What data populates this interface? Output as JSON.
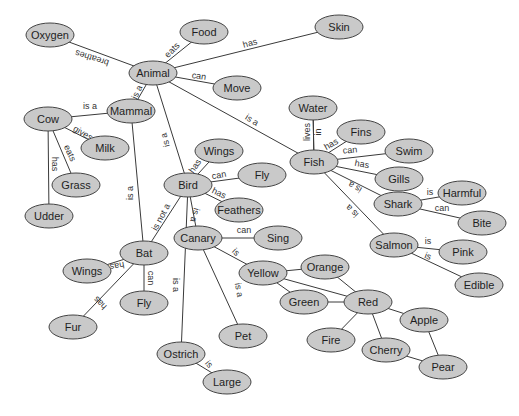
{
  "diagram": {
    "type": "semantic-network",
    "colors": {
      "node_fill": "#c9c9c9",
      "node_stroke": "#444444",
      "edge": "#3a3a3a",
      "background": "#ffffff"
    },
    "nodes": [
      {
        "id": "oxygen",
        "label": "Oxygen",
        "x": 50,
        "y": 35,
        "rx": 24,
        "ry": 12
      },
      {
        "id": "food",
        "label": "Food",
        "x": 204,
        "y": 32,
        "rx": 24,
        "ry": 12
      },
      {
        "id": "skin",
        "label": "Skin",
        "x": 339,
        "y": 27,
        "rx": 24,
        "ry": 12
      },
      {
        "id": "animal",
        "label": "Animal",
        "x": 153,
        "y": 73,
        "rx": 24,
        "ry": 12
      },
      {
        "id": "move",
        "label": "Move",
        "x": 237,
        "y": 88,
        "rx": 24,
        "ry": 12
      },
      {
        "id": "mammal",
        "label": "Mammal",
        "x": 131,
        "y": 111,
        "rx": 24,
        "ry": 12
      },
      {
        "id": "cow",
        "label": "Cow",
        "x": 48,
        "y": 119,
        "rx": 24,
        "ry": 12
      },
      {
        "id": "milk",
        "label": "Milk",
        "x": 105,
        "y": 148,
        "rx": 24,
        "ry": 12
      },
      {
        "id": "grass",
        "label": "Grass",
        "x": 76,
        "y": 185,
        "rx": 24,
        "ry": 12
      },
      {
        "id": "udder",
        "label": "Udder",
        "x": 49,
        "y": 216,
        "rx": 24,
        "ry": 12
      },
      {
        "id": "water",
        "label": "Water",
        "x": 313,
        "y": 108,
        "rx": 24,
        "ry": 12
      },
      {
        "id": "fins",
        "label": "Fins",
        "x": 361,
        "y": 132,
        "rx": 24,
        "ry": 12
      },
      {
        "id": "wings_bird",
        "label": "Wings",
        "x": 219,
        "y": 151,
        "rx": 24,
        "ry": 12
      },
      {
        "id": "fly_bird",
        "label": "Fly",
        "x": 262,
        "y": 175,
        "rx": 24,
        "ry": 12
      },
      {
        "id": "fish",
        "label": "Fish",
        "x": 314,
        "y": 162,
        "rx": 24,
        "ry": 12
      },
      {
        "id": "swim",
        "label": "Swim",
        "x": 409,
        "y": 151,
        "rx": 24,
        "ry": 12
      },
      {
        "id": "gills",
        "label": "Gills",
        "x": 399,
        "y": 179,
        "rx": 24,
        "ry": 12
      },
      {
        "id": "bird",
        "label": "Bird",
        "x": 188,
        "y": 185,
        "rx": 24,
        "ry": 12
      },
      {
        "id": "feathers",
        "label": "Feathers",
        "x": 239,
        "y": 210,
        "rx": 24,
        "ry": 12
      },
      {
        "id": "shark",
        "label": "Shark",
        "x": 398,
        "y": 204,
        "rx": 24,
        "ry": 12
      },
      {
        "id": "harmful",
        "label": "Harmful",
        "x": 462,
        "y": 193,
        "rx": 24,
        "ry": 12
      },
      {
        "id": "bite",
        "label": "Bite",
        "x": 482,
        "y": 223,
        "rx": 24,
        "ry": 12
      },
      {
        "id": "canary",
        "label": "Canary",
        "x": 198,
        "y": 238,
        "rx": 24,
        "ry": 12
      },
      {
        "id": "sing",
        "label": "Sing",
        "x": 278,
        "y": 238,
        "rx": 24,
        "ry": 12
      },
      {
        "id": "bat",
        "label": "Bat",
        "x": 144,
        "y": 253,
        "rx": 24,
        "ry": 12
      },
      {
        "id": "salmon",
        "label": "Salmon",
        "x": 394,
        "y": 245,
        "rx": 24,
        "ry": 12
      },
      {
        "id": "pink",
        "label": "Pink",
        "x": 463,
        "y": 252,
        "rx": 24,
        "ry": 12
      },
      {
        "id": "yellow",
        "label": "Yellow",
        "x": 263,
        "y": 273,
        "rx": 24,
        "ry": 12
      },
      {
        "id": "orange",
        "label": "Orange",
        "x": 325,
        "y": 267,
        "rx": 24,
        "ry": 12
      },
      {
        "id": "wings_bat",
        "label": "Wings",
        "x": 87,
        "y": 271,
        "rx": 24,
        "ry": 12
      },
      {
        "id": "green",
        "label": "Green",
        "x": 304,
        "y": 302,
        "rx": 24,
        "ry": 12
      },
      {
        "id": "red",
        "label": "Red",
        "x": 368,
        "y": 302,
        "rx": 24,
        "ry": 12
      },
      {
        "id": "edible",
        "label": "Edible",
        "x": 479,
        "y": 285,
        "rx": 24,
        "ry": 12
      },
      {
        "id": "apple",
        "label": "Apple",
        "x": 424,
        "y": 320,
        "rx": 24,
        "ry": 12
      },
      {
        "id": "fly_bat",
        "label": "Fly",
        "x": 144,
        "y": 303,
        "rx": 24,
        "ry": 12
      },
      {
        "id": "fur",
        "label": "Fur",
        "x": 73,
        "y": 327,
        "rx": 24,
        "ry": 12
      },
      {
        "id": "pet",
        "label": "Pet",
        "x": 243,
        "y": 336,
        "rx": 24,
        "ry": 12
      },
      {
        "id": "fire",
        "label": "Fire",
        "x": 331,
        "y": 340,
        "rx": 24,
        "ry": 12
      },
      {
        "id": "cherry",
        "label": "Cherry",
        "x": 386,
        "y": 350,
        "rx": 24,
        "ry": 12
      },
      {
        "id": "ostrich",
        "label": "Ostrich",
        "x": 181,
        "y": 354,
        "rx": 24,
        "ry": 12
      },
      {
        "id": "pear",
        "label": "Pear",
        "x": 443,
        "y": 367,
        "rx": 24,
        "ry": 12
      },
      {
        "id": "large",
        "label": "Large",
        "x": 227,
        "y": 382,
        "rx": 24,
        "ry": 12
      }
    ],
    "edges": [
      {
        "from": "animal",
        "to": "oxygen",
        "label": "breathes",
        "lx": 92,
        "ly": 58,
        "rot": 198
      },
      {
        "from": "animal",
        "to": "food",
        "label": "eats",
        "lx": 172,
        "ly": 50,
        "rot": -45
      },
      {
        "from": "animal",
        "to": "skin",
        "label": "has",
        "lx": 250,
        "ly": 43,
        "rot": -16
      },
      {
        "from": "animal",
        "to": "move",
        "label": "can",
        "lx": 199,
        "ly": 76,
        "rot": 8
      },
      {
        "from": "mammal",
        "to": "animal",
        "label": "is a",
        "lx": 137,
        "ly": 92,
        "rot": -65
      },
      {
        "from": "cow",
        "to": "mammal",
        "label": "is a",
        "lx": 90,
        "ly": 106,
        "rot": 0
      },
      {
        "from": "cow",
        "to": "milk",
        "label": "gives",
        "lx": 83,
        "ly": 133,
        "rot": 30
      },
      {
        "from": "cow",
        "to": "grass",
        "label": "eats",
        "lx": 70,
        "ly": 153,
        "rot": 65
      },
      {
        "from": "cow",
        "to": "udder",
        "label": "has",
        "lx": 55,
        "ly": 164,
        "rot": 90
      },
      {
        "from": "bird",
        "to": "animal",
        "label": "is a",
        "lx": 165,
        "ly": 140,
        "rot": -105
      },
      {
        "from": "fish",
        "to": "animal",
        "label": "is a",
        "lx": 252,
        "ly": 120,
        "rot": 32
      },
      {
        "from": "bat",
        "to": "mammal",
        "label": "is a",
        "lx": 130,
        "ly": 193,
        "rot": -90
      },
      {
        "from": "bat",
        "to": "bird",
        "label": "is not a",
        "lx": 161,
        "ly": 217,
        "rot": -62
      },
      {
        "from": "bird",
        "to": "wings_bird",
        "label": "has",
        "lx": 195,
        "ly": 166,
        "rot": -55
      },
      {
        "from": "bird",
        "to": "fly_bird",
        "label": "can",
        "lx": 219,
        "ly": 175,
        "rot": -10
      },
      {
        "from": "bird",
        "to": "feathers",
        "label": "has",
        "lx": 219,
        "ly": 193,
        "rot": 25
      },
      {
        "from": "canary",
        "to": "bird",
        "label": "is a",
        "lx": 195,
        "ly": 215,
        "rot": 105
      },
      {
        "from": "ostrich",
        "to": "bird",
        "label": "is a",
        "lx": 176,
        "ly": 285,
        "rot": 90
      },
      {
        "from": "canary",
        "to": "sing",
        "label": "can",
        "lx": 244,
        "ly": 230,
        "rot": 0
      },
      {
        "from": "canary",
        "to": "yellow",
        "label": "is",
        "lx": 236,
        "ly": 252,
        "rot": 45
      },
      {
        "from": "canary",
        "to": "pet",
        "label": "is a",
        "lx": 239,
        "ly": 290,
        "rot": 80
      },
      {
        "from": "ostrich",
        "to": "large",
        "label": "is",
        "lx": 209,
        "ly": 364,
        "rot": 50
      },
      {
        "from": "bat",
        "to": "wings_bat",
        "label": "has",
        "lx": 117,
        "ly": 266,
        "rot": 170
      },
      {
        "from": "bat",
        "to": "fly_bat",
        "label": "can",
        "lx": 151,
        "ly": 278,
        "rot": 90
      },
      {
        "from": "bat",
        "to": "fur",
        "label": "has",
        "lx": 100,
        "ly": 303,
        "rot": 225
      },
      {
        "from": "fish",
        "to": "water",
        "label": "lives",
        "lx": 307,
        "ly": 132,
        "rot": -90
      },
      {
        "from": "fish",
        "to": "water",
        "label": "in",
        "lx": 318,
        "ly": 132,
        "rot": -90
      },
      {
        "from": "fish",
        "to": "fins",
        "label": "has",
        "lx": 331,
        "ly": 144,
        "rot": -30
      },
      {
        "from": "fish",
        "to": "swim",
        "label": "can",
        "lx": 350,
        "ly": 150,
        "rot": -5
      },
      {
        "from": "fish",
        "to": "gills",
        "label": "has",
        "lx": 362,
        "ly": 164,
        "rot": 10
      },
      {
        "from": "shark",
        "to": "fish",
        "label": "is a",
        "lx": 355,
        "ly": 187,
        "rot": 210
      },
      {
        "from": "salmon",
        "to": "fish",
        "label": "is a",
        "lx": 352,
        "ly": 211,
        "rot": 225
      },
      {
        "from": "shark",
        "to": "harmful",
        "label": "is",
        "lx": 430,
        "ly": 192,
        "rot": 0
      },
      {
        "from": "shark",
        "to": "bite",
        "label": "can",
        "lx": 442,
        "ly": 208,
        "rot": 0
      },
      {
        "from": "salmon",
        "to": "pink",
        "label": "is",
        "lx": 428,
        "ly": 241,
        "rot": 0
      },
      {
        "from": "salmon",
        "to": "edible",
        "label": "is",
        "lx": 428,
        "ly": 256,
        "rot": 20
      },
      {
        "from": "yellow",
        "to": "orange",
        "label": "",
        "lx": 0,
        "ly": 0,
        "rot": 0
      },
      {
        "from": "yellow",
        "to": "green",
        "label": "",
        "lx": 0,
        "ly": 0,
        "rot": 0
      },
      {
        "from": "yellow",
        "to": "red",
        "label": "",
        "lx": 0,
        "ly": 0,
        "rot": 0
      },
      {
        "from": "orange",
        "to": "red",
        "label": "",
        "lx": 0,
        "ly": 0,
        "rot": 0
      },
      {
        "from": "green",
        "to": "red",
        "label": "",
        "lx": 0,
        "ly": 0,
        "rot": 0
      },
      {
        "from": "red",
        "to": "fire",
        "label": "",
        "lx": 0,
        "ly": 0,
        "rot": 0
      },
      {
        "from": "red",
        "to": "cherry",
        "label": "",
        "lx": 0,
        "ly": 0,
        "rot": 0
      },
      {
        "from": "red",
        "to": "apple",
        "label": "",
        "lx": 0,
        "ly": 0,
        "rot": 0
      },
      {
        "from": "apple",
        "to": "pear",
        "label": "",
        "lx": 0,
        "ly": 0,
        "rot": 0
      },
      {
        "from": "cherry",
        "to": "pear",
        "label": "",
        "lx": 0,
        "ly": 0,
        "rot": 0
      }
    ]
  }
}
